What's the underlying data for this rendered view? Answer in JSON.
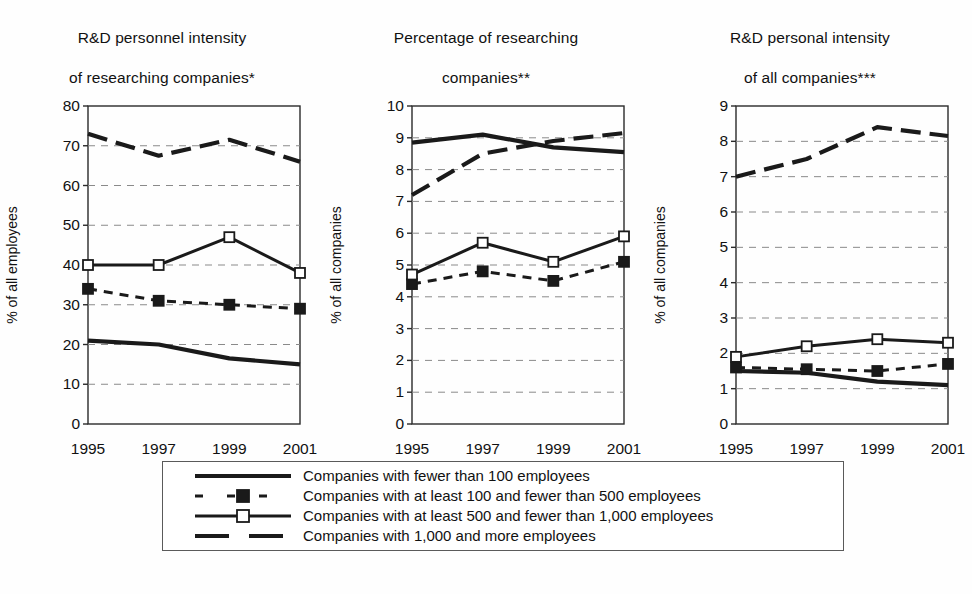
{
  "chart_data": [
    {
      "type": "line",
      "title": "R&D personnel intensity\nof researching companies*",
      "title_line1": "R&D personnel intensity",
      "title_line2": "of researching companies*",
      "xlabel": "",
      "ylabel": "% of all employees",
      "x": [
        "1995",
        "1997",
        "1999",
        "2001"
      ],
      "ylim": [
        0,
        80
      ],
      "yticks": [
        0,
        10,
        20,
        30,
        40,
        50,
        60,
        70,
        80
      ],
      "grid": "horizontal-dashed",
      "legend_position": "below-shared",
      "series": [
        {
          "name": "Companies with fewer than 100 employees",
          "style": "solid-thick",
          "marker": "none",
          "values": [
            21,
            20,
            16.5,
            15
          ]
        },
        {
          "name": "Companies with at least 100 and fewer than 500 employees",
          "style": "dashed",
          "marker": "filled-square",
          "values": [
            34,
            31,
            30,
            29
          ]
        },
        {
          "name": "Companies with at least 500 and fewer than 1,000 employees",
          "style": "solid",
          "marker": "open-square",
          "values": [
            40,
            40,
            47,
            38
          ]
        },
        {
          "name": "Companies with 1,000 and more employees",
          "style": "long-dash",
          "marker": "none",
          "values": [
            73,
            67.5,
            71.5,
            66
          ]
        }
      ]
    },
    {
      "type": "line",
      "title": "Percentage of researching\ncompanies**",
      "title_line1": "Percentage of researching",
      "title_line2": "companies**",
      "xlabel": "",
      "ylabel": "% of all companies",
      "x": [
        "1995",
        "1997",
        "1999",
        "2001"
      ],
      "ylim": [
        0,
        10
      ],
      "yticks": [
        0,
        1,
        2,
        3,
        4,
        5,
        6,
        7,
        8,
        9,
        10
      ],
      "grid": "horizontal-dashed",
      "legend_position": "below-shared",
      "series": [
        {
          "name": "Companies with fewer than 100 employees",
          "style": "solid-thick",
          "marker": "none",
          "values": [
            8.85,
            9.1,
            8.7,
            8.55
          ]
        },
        {
          "name": "Companies with at least 100 and fewer than 500 employees",
          "style": "dashed",
          "marker": "filled-square",
          "values": [
            4.4,
            4.8,
            4.5,
            5.1
          ]
        },
        {
          "name": "Companies with at least 500 and fewer than 1,000 employees",
          "style": "solid",
          "marker": "open-square",
          "values": [
            4.7,
            5.7,
            5.1,
            5.9
          ]
        },
        {
          "name": "Companies with 1,000 and more employees",
          "style": "long-dash",
          "marker": "none",
          "values": [
            7.2,
            8.5,
            8.9,
            9.15
          ]
        }
      ]
    },
    {
      "type": "line",
      "title": "R&D personal intensity\nof all companies***",
      "title_line1": "R&D personal intensity",
      "title_line2": "of all companies***",
      "xlabel": "",
      "ylabel": "% of all companies",
      "x": [
        "1995",
        "1997",
        "1999",
        "2001"
      ],
      "ylim": [
        0,
        9
      ],
      "yticks": [
        0,
        1,
        2,
        3,
        4,
        5,
        6,
        7,
        8,
        9
      ],
      "grid": "horizontal-dashed",
      "legend_position": "below-shared",
      "series": [
        {
          "name": "Companies with fewer than 100 employees",
          "style": "solid-thick",
          "marker": "none",
          "values": [
            1.5,
            1.45,
            1.2,
            1.1
          ]
        },
        {
          "name": "Companies with at least 100 and fewer than 500 employees",
          "style": "dashed",
          "marker": "filled-square",
          "values": [
            1.6,
            1.55,
            1.5,
            1.7
          ]
        },
        {
          "name": "Companies with at least 500 and fewer than 1,000 employees",
          "style": "solid",
          "marker": "open-square",
          "values": [
            1.9,
            2.2,
            2.4,
            2.3
          ]
        },
        {
          "name": "Companies with 1,000 and more employees",
          "style": "long-dash",
          "marker": "none",
          "values": [
            7.0,
            7.5,
            8.4,
            8.15
          ]
        }
      ]
    }
  ],
  "legend": {
    "items": [
      {
        "label": "Companies with fewer than 100 employees",
        "style": "solid-thick",
        "marker": "none"
      },
      {
        "label": "Companies with at least 100 and fewer than 500 employees",
        "style": "dashed",
        "marker": "filled-square"
      },
      {
        "label": "Companies with at least 500 and fewer than 1,000 employees",
        "style": "solid",
        "marker": "open-square"
      },
      {
        "label": "Companies with 1,000 and more employees",
        "style": "long-dash",
        "marker": "none"
      }
    ]
  },
  "colors": {
    "ink": "#1a1a1a",
    "axis": "#2a2a2a",
    "grid": "#8a8a8a",
    "background": "#fefefe",
    "marker_fill_open": "#ffffff"
  }
}
